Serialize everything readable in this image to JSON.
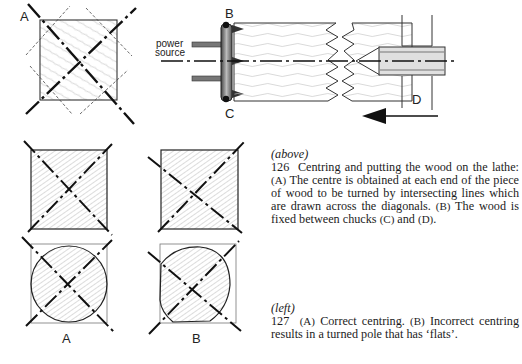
{
  "figure_a": {
    "label": "A"
  },
  "lathe_diagram": {
    "label_b": "B",
    "label_c": "C",
    "label_d": "D",
    "power_source_line1": "power",
    "power_source_line2": "source"
  },
  "figure_127": {
    "label_a": "A",
    "label_b": "B"
  },
  "caption_126": {
    "tag": "(above)",
    "number": "126",
    "text_1": "Centring and putting the wood on the lathe: ",
    "ref_a": "(A)",
    "text_2": " The centre is obtained at each end of the piece of wood to be turned by intersecting lines which are drawn across the diagonals. ",
    "ref_b": "(B)",
    "text_3": " The wood is fixed between chucks ",
    "ref_c": "(C)",
    "text_4": " and ",
    "ref_d": "(D)",
    "text_5": "."
  },
  "caption_127": {
    "tag": "(left)",
    "number": "127",
    "ref_a": "(A)",
    "text_1": " Correct centring. ",
    "ref_b": "(B)",
    "text_2": " Incorrect centring results in a turned pole that has ‘flats’."
  },
  "colors": {
    "ink": "#1a1a1a",
    "hatch": "#8a8a8a",
    "paper": "#ffffff"
  }
}
